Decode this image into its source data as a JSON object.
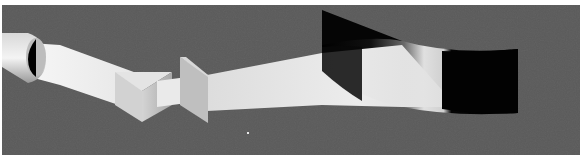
{
  "caption_fragment": "",
  "scene": {
    "description": "Rendered optical illustration: a light beam emerges from a cylindrical tube, passes through triangular prisms and onto a curved dark screen",
    "background_color": "#5a5a5a",
    "frame_color": "#ffffff",
    "beam_color": "#eeeeee",
    "shadow_color": "#050505"
  }
}
